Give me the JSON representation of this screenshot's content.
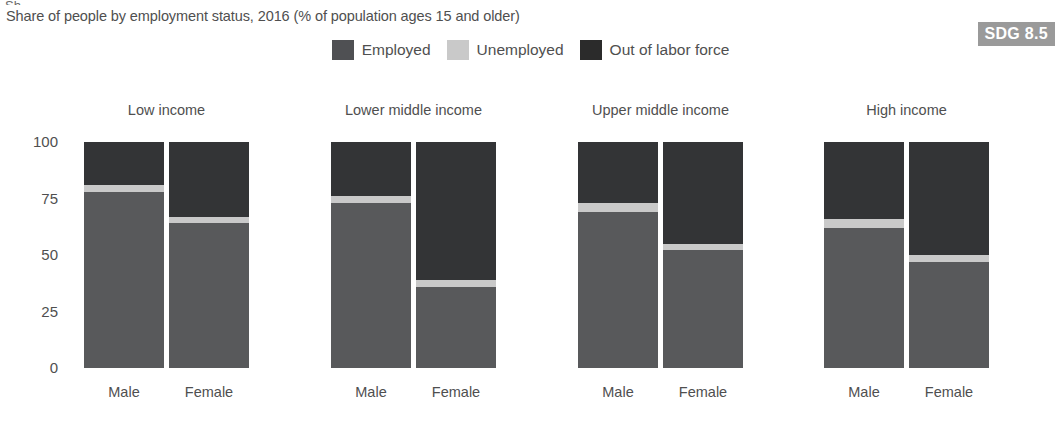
{
  "clip_artifact_text": "Sh",
  "subtitle": "Share of people by employment status, 2016 (% of population ages 15 and older)",
  "badge": {
    "label": "SDG 8.5",
    "background": "#9a9a9a",
    "text_color": "#ffffff"
  },
  "legend": {
    "items": [
      {
        "label": "Employed",
        "color": "#4f5053"
      },
      {
        "label": "Unemployed",
        "color": "#c9c9c9"
      },
      {
        "label": "Out of labor force",
        "color": "#2b2b2b"
      }
    ]
  },
  "colors": {
    "employed": "#58595b",
    "unemployed": "#c9c9c9",
    "out_of_labor_force": "#333436",
    "axis_text": "#4f4f4f"
  },
  "chart_data": {
    "type": "bar",
    "subtype": "stacked-100-grouped",
    "title": "",
    "subtitle": "Share of people by employment status, 2016 (% of population ages 15 and older)",
    "xlabel": "",
    "ylabel": "",
    "ylim": [
      0,
      100
    ],
    "yticks": [
      0,
      25,
      50,
      75,
      100
    ],
    "ytick_labels": [
      "0",
      "25",
      "50",
      "75",
      "100"
    ],
    "grid": false,
    "legend_position": "top-center",
    "groups": [
      "Low income",
      "Lower middle income",
      "Upper middle income",
      "High income"
    ],
    "subcategories": [
      "Male",
      "Female"
    ],
    "series": [
      {
        "name": "Employed",
        "values": [
          78,
          64,
          73,
          36,
          69,
          52,
          62,
          47
        ]
      },
      {
        "name": "Unemployed",
        "values": [
          3,
          3,
          3,
          3,
          4,
          3,
          4,
          3
        ]
      },
      {
        "name": "Out of labor force",
        "values": [
          19,
          33,
          24,
          61,
          27,
          45,
          34,
          50
        ]
      }
    ],
    "bars": [
      {
        "group": "Low income",
        "category": "Male",
        "employed": 78,
        "unemployed": 3,
        "out_of_labor_force": 19
      },
      {
        "group": "Low income",
        "category": "Female",
        "employed": 64,
        "unemployed": 3,
        "out_of_labor_force": 33
      },
      {
        "group": "Lower middle income",
        "category": "Male",
        "employed": 73,
        "unemployed": 3,
        "out_of_labor_force": 24
      },
      {
        "group": "Lower middle income",
        "category": "Female",
        "employed": 36,
        "unemployed": 3,
        "out_of_labor_force": 61
      },
      {
        "group": "Upper middle income",
        "category": "Male",
        "employed": 69,
        "unemployed": 4,
        "out_of_labor_force": 27
      },
      {
        "group": "Upper middle income",
        "category": "Female",
        "employed": 52,
        "unemployed": 3,
        "out_of_labor_force": 45
      },
      {
        "group": "High income",
        "category": "Male",
        "employed": 62,
        "unemployed": 4,
        "out_of_labor_force": 34
      },
      {
        "group": "High income",
        "category": "Female",
        "employed": 47,
        "unemployed": 3,
        "out_of_labor_force": 50
      }
    ]
  },
  "group_titles": [
    "Low income",
    "Lower middle income",
    "Upper middle income",
    "High income"
  ],
  "x_labels": [
    "Male",
    "Female",
    "Male",
    "Female",
    "Male",
    "Female",
    "Male",
    "Female"
  ]
}
